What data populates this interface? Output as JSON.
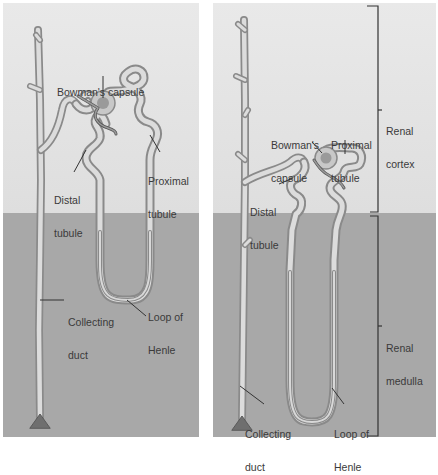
{
  "colors": {
    "cortex": "#e7e7e7",
    "medulla": "#a8a8a8",
    "tube_fill": "#dcdcdc",
    "tube_edge": "#8c8c8c",
    "glomerulus": "#9a9a9a",
    "leader": "#333333",
    "gap": "#ffffff"
  },
  "left_panel": {
    "labels": {
      "bowmans_capsule": "Bowman's capsule",
      "proximal_tubule": [
        "Proximal",
        "tubule"
      ],
      "distal_tubule": [
        "Distal",
        "tubule"
      ],
      "collecting_duct": [
        "Collecting",
        "duct"
      ],
      "loop_of_henle": [
        "Loop of",
        "Henle"
      ]
    }
  },
  "right_panel": {
    "labels": {
      "bowmans_capsule": [
        "Bowman's",
        "capsule"
      ],
      "proximal_tubule": [
        "Proximal",
        "tubule"
      ],
      "distal_tubule": [
        "Distal",
        "tubule"
      ],
      "collecting_duct": [
        "Collecting",
        "duct"
      ],
      "loop_of_henle": [
        "Loop of",
        "Henle"
      ],
      "renal_cortex": [
        "Renal",
        "cortex"
      ],
      "renal_medulla": [
        "Renal",
        "medulla"
      ]
    }
  }
}
